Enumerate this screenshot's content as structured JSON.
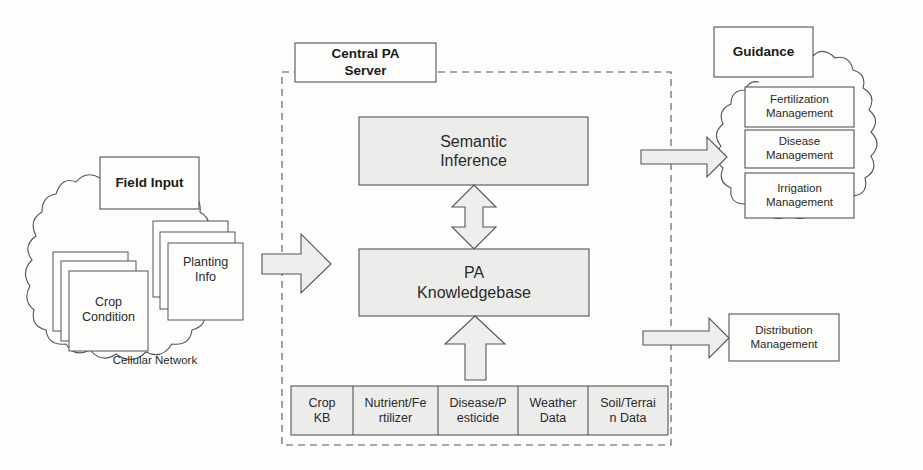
{
  "colors": {
    "background": "#fdfdfb",
    "stroke": "#555555",
    "box_fill_gray": "#ececea",
    "arrow_fill": "#eeeeec"
  },
  "field_input": {
    "title": "Field Input",
    "crop_condition": "Crop\nCondition",
    "planting_info": "Planting\nInfo",
    "network_label": "Cellular Network"
  },
  "central_server": {
    "title": "Central PA\nServer",
    "semantic_inference": "Semantic\nInference",
    "knowledgebase": "PA\nKnowledgebase",
    "data_sources": [
      {
        "label": "Crop\nKB"
      },
      {
        "label": "Nutrient/Fe\nrtilizer"
      },
      {
        "label": "Disease/P\nesticide"
      },
      {
        "label": "Weather\nData"
      },
      {
        "label": "Soil/Terrai\nn Data"
      }
    ]
  },
  "guidance": {
    "title": "Guidance",
    "items": [
      {
        "label": "Fertilization\nManagement"
      },
      {
        "label": "Disease\nManagement"
      },
      {
        "label": "Irrigation\nManagement"
      }
    ]
  },
  "distribution": {
    "label": "Distribution\nManagement"
  }
}
